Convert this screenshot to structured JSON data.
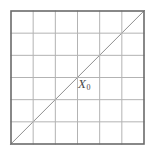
{
  "figure": {
    "background_color": "#ffffff",
    "width": 155,
    "height": 162
  },
  "mesh": {
    "type": "triangulated-square-grid",
    "columns": 6,
    "rows": 6,
    "cell_size": 22.17,
    "origin_x": 11,
    "origin_y": 11,
    "extent_x": 144,
    "extent_y": 144,
    "diagonal_direction": "bottom-left-to-top-right",
    "border_color": "#6b6b6b",
    "border_width": 1.6,
    "grid_line_color": "#b3b3b3",
    "grid_line_width": 1.0,
    "diagonal_color": "#9a9a9a",
    "diagonal_width": 1.0
  },
  "labels": [
    {
      "id": "x0",
      "base": "X",
      "subscript": "0",
      "x": 78,
      "y": 77,
      "color": "#4a4a4a"
    }
  ],
  "chart_data": {
    "type": "diagram",
    "columns": 6,
    "rows": 6,
    "cells": 36,
    "triangles": 72,
    "vertical_lines": 7,
    "horizontal_lines": 7,
    "diagonal_lines": 11,
    "annotations": [
      "X₀"
    ],
    "xlabel": "",
    "ylabel": "",
    "xlim": [
      0,
      6
    ],
    "ylim": [
      0,
      6
    ],
    "grid": true,
    "legend": "none"
  }
}
